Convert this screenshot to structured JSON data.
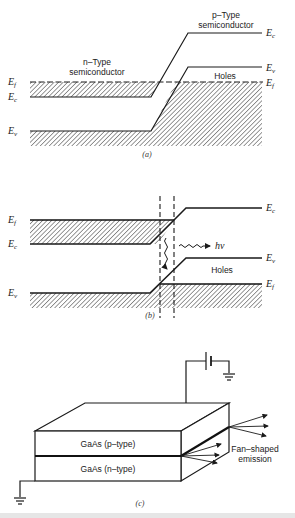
{
  "panels": {
    "a": {
      "caption": "(a)",
      "n_label_line1": "n–Type",
      "n_label_line2": "semiconductor",
      "p_label_line1": "p–Type",
      "p_label_line2": "semiconductor",
      "holes_label": "Holes",
      "left_labels": {
        "ef": "E",
        "ef_sub": "f",
        "ec": "E",
        "ec_sub": "c",
        "ev": "E",
        "ev_sub": "v"
      },
      "right_labels": {
        "ec": "E",
        "ec_sub": "c",
        "ev": "E",
        "ev_sub": "v",
        "ef": "E",
        "ef_sub": "f"
      }
    },
    "b": {
      "caption": "(b)",
      "holes_label": "Holes",
      "photon_label": "hν",
      "left_labels": {
        "ef": "E",
        "ef_sub": "f",
        "ec": "E",
        "ec_sub": "c",
        "ev": "E",
        "ev_sub": "v"
      },
      "right_labels": {
        "ec": "E",
        "ec_sub": "c",
        "ev": "E",
        "ev_sub": "v",
        "ef": "E",
        "ef_sub": "f"
      }
    },
    "c": {
      "caption": "(c)",
      "p_layer_label": "GaAs (p–type)",
      "n_layer_label": "GaAs (n–type)",
      "emission_label_line1": "Fan–shaped",
      "emission_label_line2": "emission"
    }
  },
  "colors": {
    "line": "#1a1a1a",
    "hatch": "#333333",
    "background": "#ffffff"
  }
}
